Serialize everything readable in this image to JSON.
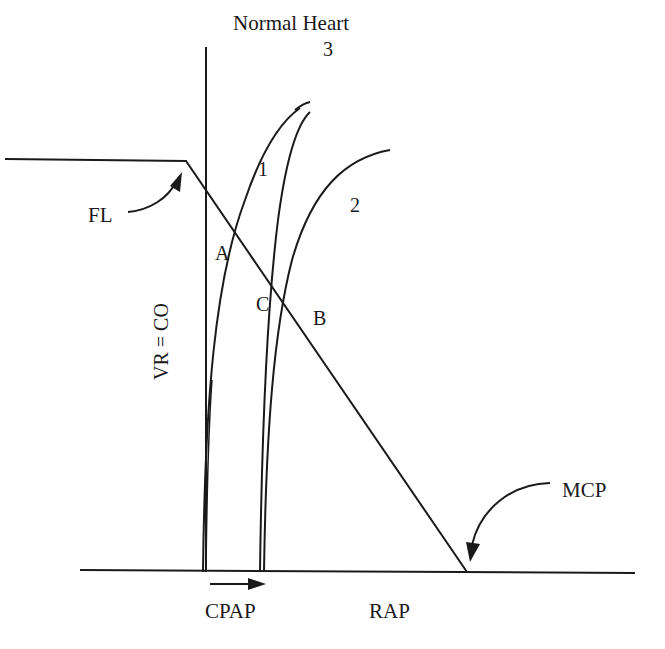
{
  "title": "Normal Heart",
  "axes": {
    "y_label": "VR = CO",
    "x_label": "RAP"
  },
  "curves": {
    "curve_1_label": "1",
    "curve_2_label": "2",
    "curve_3_label": "3"
  },
  "points": {
    "a": "A",
    "b": "B",
    "c": "C"
  },
  "annotations": {
    "fl": "FL",
    "mcp": "MCP",
    "cpap": "CPAP"
  },
  "colors": {
    "line": "#1a1a1a",
    "background": "#ffffff"
  }
}
